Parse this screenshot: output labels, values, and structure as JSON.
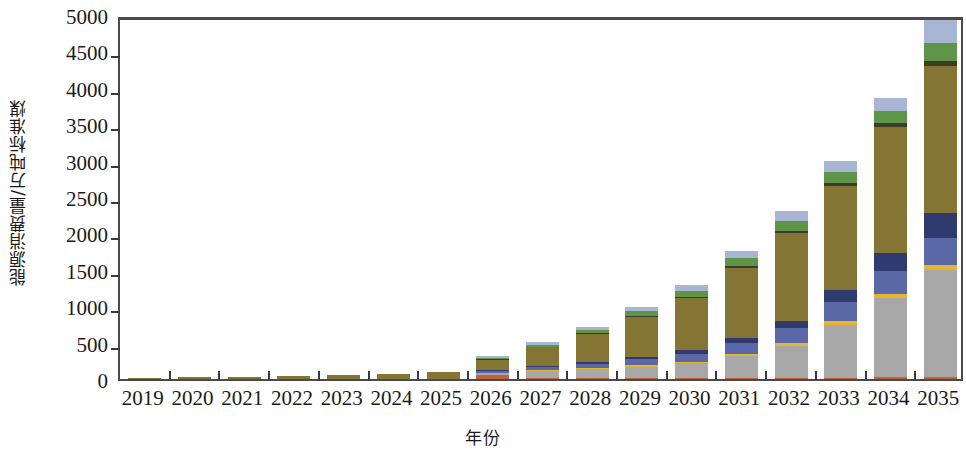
{
  "chart_data": {
    "type": "bar",
    "stacked": true,
    "title": "",
    "xlabel": "年份",
    "ylabel": "能源消费量/万吨标准煤",
    "categories": [
      "2019",
      "2020",
      "2021",
      "2022",
      "2023",
      "2024",
      "2025",
      "2026",
      "2027",
      "2028",
      "2029",
      "2030",
      "2031",
      "2032",
      "2033",
      "2034",
      "2035"
    ],
    "ylim": [
      0,
      5000
    ],
    "yticks": [
      0,
      500,
      1000,
      1500,
      2000,
      2500,
      3000,
      3500,
      4000,
      4500,
      5000
    ],
    "grid": false,
    "legend": "none",
    "series": [
      {
        "name": "series-1",
        "color": "#C1613B",
        "values": [
          0,
          0,
          0,
          0,
          0,
          0,
          0,
          55,
          10,
          8,
          8,
          10,
          12,
          14,
          18,
          22,
          30
        ]
      },
      {
        "name": "series-2",
        "color": "#A8A8A8",
        "values": [
          0,
          0,
          0,
          0,
          0,
          0,
          0,
          25,
          105,
          130,
          160,
          205,
          300,
          440,
          730,
          1090,
          1470
        ]
      },
      {
        "name": "series-3",
        "color": "#E8B62C",
        "values": [
          0,
          0,
          0,
          0,
          0,
          0,
          0,
          8,
          12,
          14,
          18,
          22,
          28,
          35,
          45,
          55,
          70
        ]
      },
      {
        "name": "series-4",
        "color": "#5A68A8",
        "values": [
          0,
          0,
          0,
          0,
          0,
          0,
          0,
          20,
          40,
          60,
          85,
          110,
          160,
          215,
          270,
          320,
          370
        ]
      },
      {
        "name": "series-5",
        "color": "#2F3A6E",
        "values": [
          0,
          0,
          0,
          0,
          0,
          0,
          0,
          10,
          18,
          25,
          35,
          48,
          70,
          100,
          160,
          250,
          345
        ]
      },
      {
        "name": "series-6",
        "color": "#857535",
        "values": [
          18,
          28,
          34,
          40,
          52,
          70,
          92,
          150,
          250,
          380,
          550,
          720,
          960,
          1200,
          1430,
          1720,
          2020
        ]
      },
      {
        "name": "series-7",
        "color": "#3B3D28",
        "values": [
          0,
          0,
          0,
          0,
          0,
          0,
          0,
          5,
          8,
          10,
          14,
          18,
          25,
          35,
          45,
          55,
          65
        ]
      },
      {
        "name": "series-8",
        "color": "#5E9548",
        "values": [
          0,
          0,
          0,
          0,
          0,
          0,
          0,
          22,
          30,
          45,
          60,
          78,
          105,
          135,
          140,
          165,
          250
        ]
      },
      {
        "name": "series-9",
        "color": "#A8B6D4",
        "values": [
          0,
          0,
          0,
          0,
          0,
          0,
          0,
          25,
          35,
          48,
          60,
          75,
          100,
          130,
          155,
          180,
          310
        ]
      }
    ],
    "totals": [
      18,
      28,
      34,
      40,
      52,
      70,
      92,
      320,
      508,
      720,
      990,
      1286,
      1760,
      2304,
      2993,
      3857,
      4930
    ]
  },
  "axis": {
    "y_tick_labels": [
      "0",
      "500",
      "1000",
      "1500",
      "2000",
      "2500",
      "3000",
      "3500",
      "4000",
      "4500",
      "5000"
    ],
    "x_tick_labels": [
      "2019",
      "2020",
      "2021",
      "2022",
      "2023",
      "2024",
      "2025",
      "2026",
      "2027",
      "2028",
      "2029",
      "2030",
      "2031",
      "2032",
      "2033",
      "2034",
      "2035"
    ]
  },
  "colors": {
    "axis": "#4a4a4a",
    "text": "#1a1a1a",
    "background": "#ffffff"
  }
}
